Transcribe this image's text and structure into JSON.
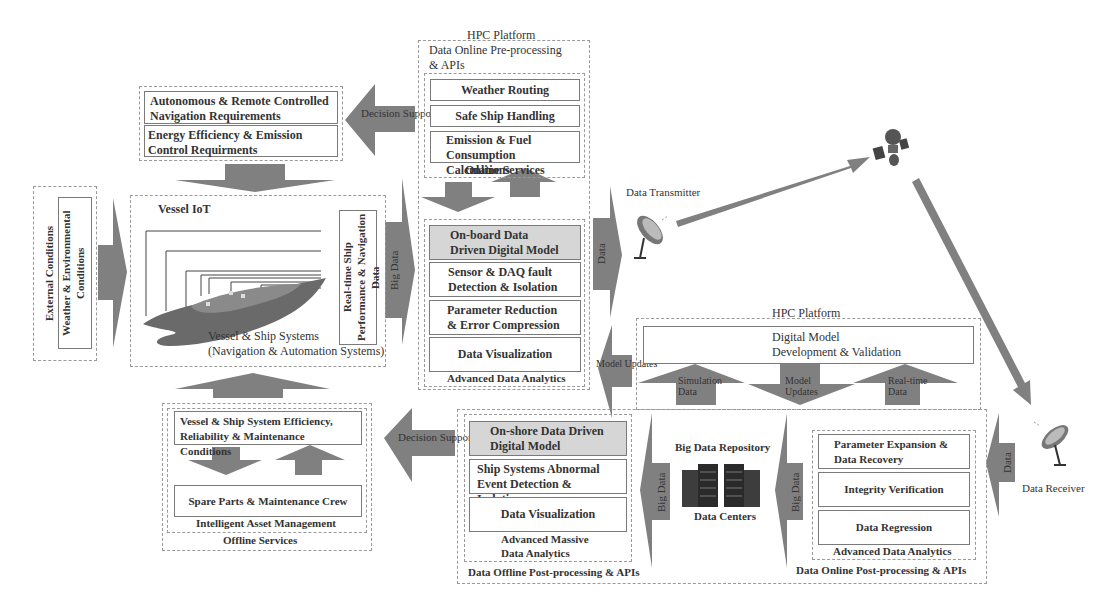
{
  "onboard_hpc": {
    "title": "HPC Platform",
    "subtitle_line1": "Data Online Pre-processing",
    "subtitle_line2": "& APIs",
    "online_services": {
      "label": "Online Services",
      "items": [
        "Weather Routing",
        "Safe Ship Handling",
        "Emission & Fuel Consumption Calculations"
      ]
    },
    "advanced_analytics": {
      "label": "Advanced Data Analytics",
      "items": [
        "On-board Data Driven Digital Model",
        "Sensor & DAQ fault Detection & Isolation",
        "Parameter Reduction & Error Compression",
        "Data Visualization"
      ]
    }
  },
  "requirements": {
    "items": [
      "Autonomous & Remote Controlled Navigation Requirements",
      "Energy Efficiency & Emission Control Requirments"
    ]
  },
  "external": {
    "outer_label": "External Conditions",
    "inner_label": "Weather & Environmental Conditions"
  },
  "vessel": {
    "iot_label": "Vessel IoT",
    "systems_line1": "Vessel & Ship Systems",
    "systems_line2": "(Navigation & Automation Systems)",
    "realtime_label": "Real-time Ship Performance & Navigation Data"
  },
  "arrows": {
    "decision_supporting_top": "Decision Supporting",
    "big_data_1": "Big Data",
    "data_tx": "Data",
    "model_updates_left": "Model Updates",
    "simulation_data": "Simulation Data",
    "model_updates_mid": "Model Updates",
    "realtime_data": "Real-time Data",
    "decision_supporting_bottom": "Decision Supporting",
    "big_data_2": "Big Data",
    "big_data_3": "Big Data",
    "data_rx": "Data"
  },
  "comm": {
    "transmitter": "Data Transmitter",
    "receiver": "Data Receiver"
  },
  "onshore_hpc": {
    "title": "HPC Platform",
    "digital_model_line1": "Digital Model",
    "digital_model_line2": "Development & Validation"
  },
  "offline": {
    "label": "Offline Services",
    "asset_label": "Intelligent Asset Management",
    "items": [
      "Vessel & Ship System Efficiency, Reliability & Maintenance  Conditions",
      "Spare Parts & Maintenance Crew"
    ]
  },
  "offline_post": {
    "label": "Data Offline Post-processing & APIs",
    "analytics_label_line1": "Advanced Massive",
    "analytics_label_line2": "Data Analytics",
    "items": [
      "On-shore Data Driven Digital Model",
      "Ship Systems Abnormal Event Detection & Isolation",
      "Data Visualization"
    ]
  },
  "repository": {
    "title": "Big Data Repository",
    "label": "Data Centers"
  },
  "online_post": {
    "label": "Data Online Post-processing & APIs",
    "analytics_label": "Advanced Data Analytics",
    "items": [
      "Parameter Expansion & Data Recovery",
      "Integrity Verification",
      "Data Regression"
    ]
  },
  "colors": {
    "arrow": "#7d7d7d",
    "grey_box": "#d6d6d6",
    "border": "#7a7a7a"
  }
}
